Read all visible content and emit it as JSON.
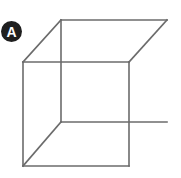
{
  "figure": {
    "label": "A",
    "colors": {
      "line": "#6b6b6b",
      "badge_bg": "#1f1f1f",
      "badge_text": "#ffffff",
      "background": "#ffffff"
    },
    "vertices": {
      "back_top_left": [
        61,
        20
      ],
      "back_top_right": [
        167,
        20
      ],
      "back_bottom_left": [
        61,
        122
      ],
      "back_bottom_right": [
        167,
        122
      ],
      "front_top_left": [
        23,
        62
      ],
      "front_top_right": [
        129,
        62
      ],
      "front_bottom_left": [
        23,
        166
      ],
      "front_bottom_right": [
        129,
        166
      ]
    }
  }
}
